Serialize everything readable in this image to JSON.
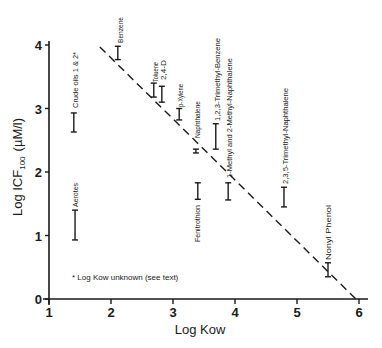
{
  "chart_data": {
    "type": "scatter",
    "title": "",
    "xlabel": "Log Kow",
    "ylabel": "Log ICF100 (µM/l)",
    "ylabel_parts": {
      "main": "Log ICF",
      "sub": "100",
      "units": "(µM/l)"
    },
    "xlim": [
      1,
      6
    ],
    "ylim": [
      0,
      4
    ],
    "x_ticks": [
      1,
      2,
      3,
      4,
      5,
      6
    ],
    "y_ticks": [
      0,
      1,
      2,
      3,
      4
    ],
    "grid": false,
    "legend": null,
    "annotation": "* Log Kow unknown (see text)",
    "error_bars": [
      {
        "label": "Crude oils 1 & 2*",
        "x": 1.4,
        "y_low": 2.63,
        "y_high": 2.93
      },
      {
        "label": "Aerotes",
        "x": 1.42,
        "y_low": 0.93,
        "y_high": 1.4
      },
      {
        "label": "Benzene",
        "x": 2.11,
        "y_low": 3.77,
        "y_high": 3.98
      },
      {
        "label": "Toluene",
        "x": 2.69,
        "y_low": 3.18,
        "y_high": 3.4
      },
      {
        "label": "2,4-D",
        "x": 2.82,
        "y_low": 3.1,
        "y_high": 3.35
      },
      {
        "label": "p-Xylene",
        "x": 3.1,
        "y_low": 2.82,
        "y_high": 3.0
      },
      {
        "label": "Naphthalene",
        "x": 3.37,
        "y_low": 2.3,
        "y_high": 2.36
      },
      {
        "label": "Fenitrothion",
        "x": 3.4,
        "y_low": 1.57,
        "y_high": 1.83
      },
      {
        "label": "1,2,3-Trimethyl-Benzene",
        "x": 3.69,
        "y_low": 2.36,
        "y_high": 2.76
      },
      {
        "label": "1-Methyl and 2-Methyl-Naphthalene",
        "x": 3.89,
        "y_low": 1.56,
        "y_high": 1.83
      },
      {
        "label": "2,3,5-Trimethyl-Naphthalene",
        "x": 4.79,
        "y_low": 1.45,
        "y_high": 1.76
      },
      {
        "label": "Nonyl Phenol",
        "x": 5.5,
        "y_low": 0.35,
        "y_high": 0.57
      }
    ],
    "regression_line": {
      "style": "dashed",
      "x": [
        1.82,
        5.95
      ],
      "y": [
        3.97,
        0.0
      ]
    }
  },
  "layout": {
    "plot": {
      "x0_px": 49,
      "x_per_unit": 62,
      "y0_px": 299,
      "y_per_unit": 63.5,
      "x_axis_end_px": 368
    },
    "labels": [
      {
        "cx": 75,
        "top": 52,
        "bottom": 108
      },
      {
        "cx": 75,
        "top": 183,
        "bottom": 207
      },
      {
        "cx": 120,
        "top": 17,
        "bottom": 43
      },
      {
        "cx": 155,
        "top": 62,
        "bottom": 82
      },
      {
        "cx": 163,
        "top": 60,
        "bottom": 80
      },
      {
        "cx": 180,
        "top": 84,
        "bottom": 107
      },
      {
        "cx": 197,
        "top": 101,
        "bottom": 138
      },
      {
        "cx": 197,
        "top": 205,
        "bottom": 242
      },
      {
        "cx": 217,
        "top": 38,
        "bottom": 121
      },
      {
        "cx": 229,
        "top": 58,
        "bottom": 178
      },
      {
        "cx": 285,
        "top": 88,
        "bottom": 184
      },
      {
        "cx": 328,
        "top": 205,
        "bottom": 260
      }
    ],
    "note_pos": {
      "x": 72,
      "y": 280
    }
  }
}
